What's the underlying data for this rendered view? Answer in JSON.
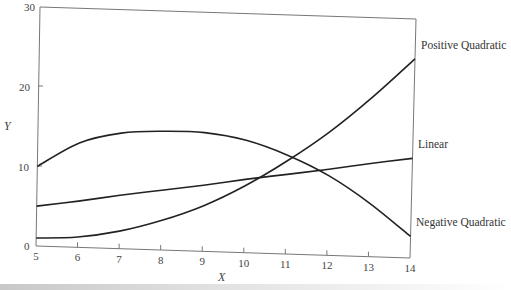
{
  "chart_data": {
    "type": "line",
    "title": "",
    "xlabel": "X",
    "ylabel": "Y",
    "xlim": [
      5,
      14
    ],
    "ylim": [
      0,
      30
    ],
    "x_ticks": [
      5,
      6,
      7,
      8,
      9,
      10,
      11,
      12,
      13,
      14
    ],
    "y_ticks": [
      0,
      10,
      20,
      30
    ],
    "grid": false,
    "legend_position": "inline-right",
    "x": [
      5,
      6,
      7,
      8,
      9,
      10,
      11,
      12,
      13,
      14
    ],
    "series": [
      {
        "name": "Positive Quadratic",
        "values": [
          1.0,
          1.3,
          2.2,
          3.7,
          5.7,
          8.4,
          11.7,
          15.5,
          20.0,
          25.0
        ]
      },
      {
        "name": "Linear",
        "values": [
          5.0,
          5.8,
          6.7,
          7.5,
          8.3,
          9.2,
          10.0,
          10.8,
          11.7,
          12.5
        ]
      },
      {
        "name": "Negative Quadratic",
        "values": [
          10.0,
          13.1,
          14.5,
          14.9,
          14.9,
          14.1,
          12.4,
          10.0,
          6.7,
          2.7
        ]
      }
    ]
  },
  "labels": {
    "x_axis_title": "X",
    "y_axis_title": "Y",
    "y_tick_0": "0",
    "y_tick_10": "10",
    "y_tick_20": "20",
    "y_tick_30": "30",
    "x_ticks": [
      "5",
      "6",
      "7",
      "8",
      "9",
      "10",
      "11",
      "12",
      "13",
      "14"
    ],
    "series_positive": "Positive Quadratic",
    "series_linear": "Linear",
    "series_negative": "Negative Quadratic"
  }
}
